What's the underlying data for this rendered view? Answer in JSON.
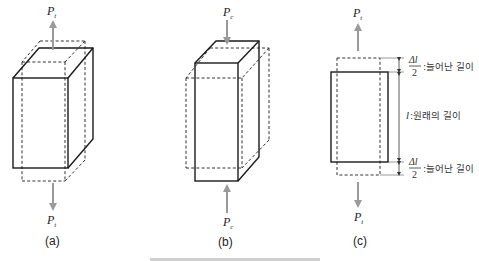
{
  "diagram": {
    "panels": [
      {
        "id": "a",
        "label": "(a)",
        "description": "tension: block elongates vertically and narrows",
        "force_top": {
          "symbol": "P",
          "subscript": "t",
          "direction": "up"
        },
        "force_bottom": {
          "symbol": "P",
          "subscript": "t",
          "direction": "down"
        }
      },
      {
        "id": "b",
        "label": "(b)",
        "description": "compression: block shortens vertically and widens",
        "force_top": {
          "symbol": "P",
          "subscript": "c",
          "direction": "down"
        },
        "force_bottom": {
          "symbol": "P",
          "subscript": "c",
          "direction": "up"
        }
      },
      {
        "id": "c",
        "label": "(c)",
        "description": "side view of elongation with dimensions",
        "force_top": {
          "symbol": "P",
          "subscript": "t",
          "direction": "up"
        },
        "force_bottom": {
          "symbol": "P",
          "subscript": "t",
          "direction": "down"
        },
        "annotations": {
          "top_delta": {
            "numerator": "Δl",
            "denominator": "2",
            "text": ":늘어난 길이"
          },
          "original": {
            "symbol": "l",
            "text": ":원래의 길이"
          },
          "bottom_delta": {
            "numerator": "Δl",
            "denominator": "2",
            "text": ":늘어난 길이"
          }
        }
      }
    ],
    "caption_partial": "(잘린 캡션)"
  },
  "colors": {
    "solid_line": "#1a1a1a",
    "dashed_line": "#333333",
    "force_arrow": "#9a9a9a"
  }
}
